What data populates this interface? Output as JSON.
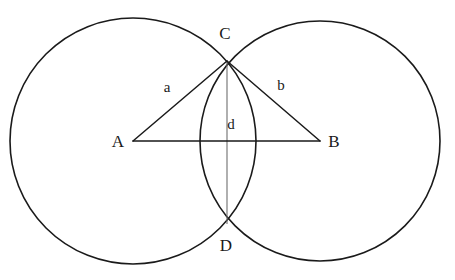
{
  "figure": {
    "background_color": "#ffffff",
    "width": 455,
    "height": 280
  },
  "style": {
    "circle_stroke": "#1a1a1a",
    "circle_stroke_width": 1.6,
    "triangle_stroke": "#1a1a1a",
    "triangle_stroke_width": 1.5,
    "chord_stroke": "#6e6e6e",
    "chord_stroke_width": 1.1,
    "label_color": "#1a1a1a"
  },
  "circles": [
    {
      "name": "circle-left",
      "center_label": "A",
      "cx": 133,
      "cy": 141,
      "r": 123
    },
    {
      "name": "circle-right",
      "center_label": "B",
      "cx": 320,
      "cy": 141,
      "r": 120
    }
  ],
  "points": {
    "A": {
      "label": "A",
      "x": 133,
      "y": 141,
      "label_x": 118,
      "label_y": 143
    },
    "B": {
      "label": "B",
      "x": 320,
      "y": 141,
      "label_x": 334,
      "label_y": 143
    },
    "C": {
      "label": "C",
      "x": 227,
      "y": 61,
      "label_x": 225,
      "label_y": 35
    },
    "D": {
      "label": "D",
      "x": 227,
      "y": 224,
      "label_x": 226,
      "label_y": 247
    }
  },
  "segments": [
    {
      "name": "segment-AC",
      "label": "a",
      "from": "A",
      "to": "C",
      "label_x": 167,
      "label_y": 89
    },
    {
      "name": "segment-CB",
      "label": "b",
      "from": "C",
      "to": "B",
      "label_x": 281,
      "label_y": 87
    },
    {
      "name": "segment-AB",
      "label": "",
      "from": "A",
      "to": "B",
      "label_x": 0,
      "label_y": 0
    },
    {
      "name": "segment-CD",
      "label": "d",
      "from": "C",
      "to": "D",
      "label_x": 231,
      "label_y": 126
    }
  ],
  "labels": {
    "A": "A",
    "B": "B",
    "C": "C",
    "D": "D",
    "a": "a",
    "b": "b",
    "d": "d"
  }
}
